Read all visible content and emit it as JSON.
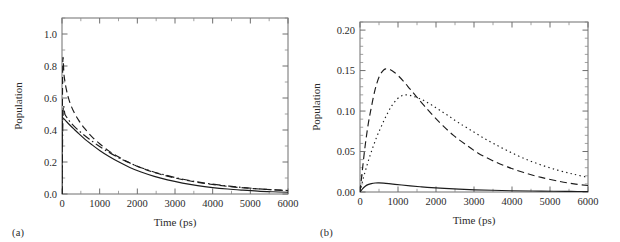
{
  "figure": {
    "panels": [
      {
        "tag": "(a)"
      },
      {
        "tag": "(b)"
      }
    ]
  },
  "chart_data": [
    {
      "panel": "(a)",
      "type": "line",
      "title": "",
      "xlabel": "Time (ps)",
      "ylabel": "Population",
      "xlim": [
        0,
        6000
      ],
      "ylim": [
        0.0,
        1.1
      ],
      "xticks": [
        0,
        1000,
        2000,
        3000,
        4000,
        5000,
        6000
      ],
      "xtick_labels": [
        "0",
        "1000",
        "2000",
        "3000",
        "4000",
        "5000",
        "6000"
      ],
      "yticks": [
        0.0,
        0.2,
        0.4,
        0.6,
        0.8,
        1.0
      ],
      "ytick_labels": [
        "0.0",
        "0.2",
        "0.4",
        "0.6",
        "0.8",
        "1.0"
      ],
      "x_minor_step": 500,
      "y_minor_step": 0.1,
      "grid": false,
      "legend": null,
      "series": [
        {
          "name": "solid",
          "style": "solid",
          "x": [
            0,
            0,
            60,
            130,
            220,
            330,
            460,
            620,
            800,
            1000,
            1250,
            1500,
            1800,
            2100,
            2450,
            2800,
            3200,
            3600,
            4000,
            4400,
            4800,
            5200,
            5600,
            6000
          ],
          "y": [
            0.0,
            0.482,
            0.468,
            0.45,
            0.428,
            0.403,
            0.374,
            0.34,
            0.307,
            0.272,
            0.234,
            0.201,
            0.166,
            0.137,
            0.11,
            0.088,
            0.068,
            0.052,
            0.04,
            0.031,
            0.024,
            0.018,
            0.014,
            0.011
          ]
        },
        {
          "name": "dashed",
          "style": "dashed",
          "x": [
            0,
            20,
            55,
            110,
            190,
            300,
            440,
            600,
            790,
            1000,
            1250,
            1520,
            1820,
            2150,
            2500,
            2880,
            3280,
            3700,
            4140,
            4600,
            5080,
            5550,
            6000
          ],
          "y": [
            0.0,
            0.81,
            0.74,
            0.66,
            0.585,
            0.52,
            0.462,
            0.41,
            0.359,
            0.314,
            0.268,
            0.229,
            0.192,
            0.159,
            0.131,
            0.107,
            0.086,
            0.069,
            0.055,
            0.043,
            0.034,
            0.027,
            0.022
          ]
        },
        {
          "name": "dash-dot",
          "style": "dash-dot",
          "x": [
            0,
            30,
            80,
            150,
            250,
            380,
            540,
            720,
            930,
            1160,
            1420,
            1700,
            2020,
            2360,
            2730,
            3120,
            3540,
            3980,
            4440,
            4920,
            5420,
            6000
          ],
          "y": [
            0.0,
            0.52,
            0.497,
            0.472,
            0.441,
            0.41,
            0.377,
            0.344,
            0.308,
            0.272,
            0.237,
            0.204,
            0.172,
            0.144,
            0.119,
            0.097,
            0.078,
            0.062,
            0.049,
            0.038,
            0.029,
            0.021
          ]
        }
      ]
    },
    {
      "panel": "(b)",
      "type": "line",
      "title": "",
      "xlabel": "Time (ps)",
      "ylabel": "Population",
      "xlim": [
        0,
        6000
      ],
      "ylim": [
        0.0,
        0.21
      ],
      "xticks": [
        0,
        1000,
        2000,
        3000,
        4000,
        5000,
        6000
      ],
      "xtick_labels": [
        "0",
        "1000",
        "2000",
        "3000",
        "4000",
        "5000",
        "6000"
      ],
      "yticks": [
        0.0,
        0.05,
        0.1,
        0.15,
        0.2
      ],
      "ytick_labels": [
        "0.00",
        "0.05",
        "0.10",
        "0.15",
        "0.20"
      ],
      "x_minor_step": 500,
      "y_minor_step": 0.01,
      "grid": false,
      "legend": null,
      "series": [
        {
          "name": "solid",
          "style": "solid",
          "x": [
            0,
            60,
            130,
            210,
            300,
            400,
            500,
            620,
            760,
            920,
            1100,
            1320,
            1580,
            1880,
            2220,
            2600,
            3020,
            3480,
            3980,
            4520,
            5100,
            5550,
            6000
          ],
          "y": [
            0.0,
            0.0035,
            0.0068,
            0.0091,
            0.0104,
            0.0111,
            0.0112,
            0.0109,
            0.0103,
            0.0095,
            0.0086,
            0.0076,
            0.0065,
            0.0054,
            0.0044,
            0.0035,
            0.0027,
            0.0021,
            0.0016,
            0.0012,
            0.0009,
            0.0007,
            0.0006
          ]
        },
        {
          "name": "dashed",
          "style": "dashed",
          "x": [
            0,
            60,
            130,
            210,
            300,
            400,
            510,
            630,
            710,
            800,
            900,
            1020,
            1160,
            1320,
            1500,
            1700,
            1930,
            2180,
            2460,
            2770,
            3110,
            3480,
            3880,
            4310,
            4770,
            5260,
            5630,
            6000
          ],
          "y": [
            0.0,
            0.026,
            0.055,
            0.082,
            0.105,
            0.127,
            0.143,
            0.151,
            0.152,
            0.151,
            0.148,
            0.143,
            0.136,
            0.127,
            0.117,
            0.106,
            0.094,
            0.082,
            0.07,
            0.059,
            0.048,
            0.039,
            0.031,
            0.024,
            0.018,
            0.013,
            0.01,
            0.008
          ]
        },
        {
          "name": "dotted",
          "style": "dotted",
          "x": [
            0,
            60,
            140,
            230,
            330,
            440,
            560,
            690,
            830,
            980,
            1100,
            1200,
            1300,
            1420,
            1560,
            1720,
            1900,
            2100,
            2330,
            2580,
            2860,
            3170,
            3510,
            3880,
            4290,
            4730,
            5200,
            5620,
            6000
          ],
          "y": [
            0.0,
            0.012,
            0.026,
            0.04,
            0.054,
            0.068,
            0.081,
            0.094,
            0.106,
            0.115,
            0.119,
            0.12,
            0.1195,
            0.118,
            0.1155,
            0.112,
            0.107,
            0.101,
            0.094,
            0.086,
            0.078,
            0.069,
            0.06,
            0.051,
            0.042,
            0.034,
            0.027,
            0.022,
            0.018
          ]
        }
      ]
    }
  ]
}
